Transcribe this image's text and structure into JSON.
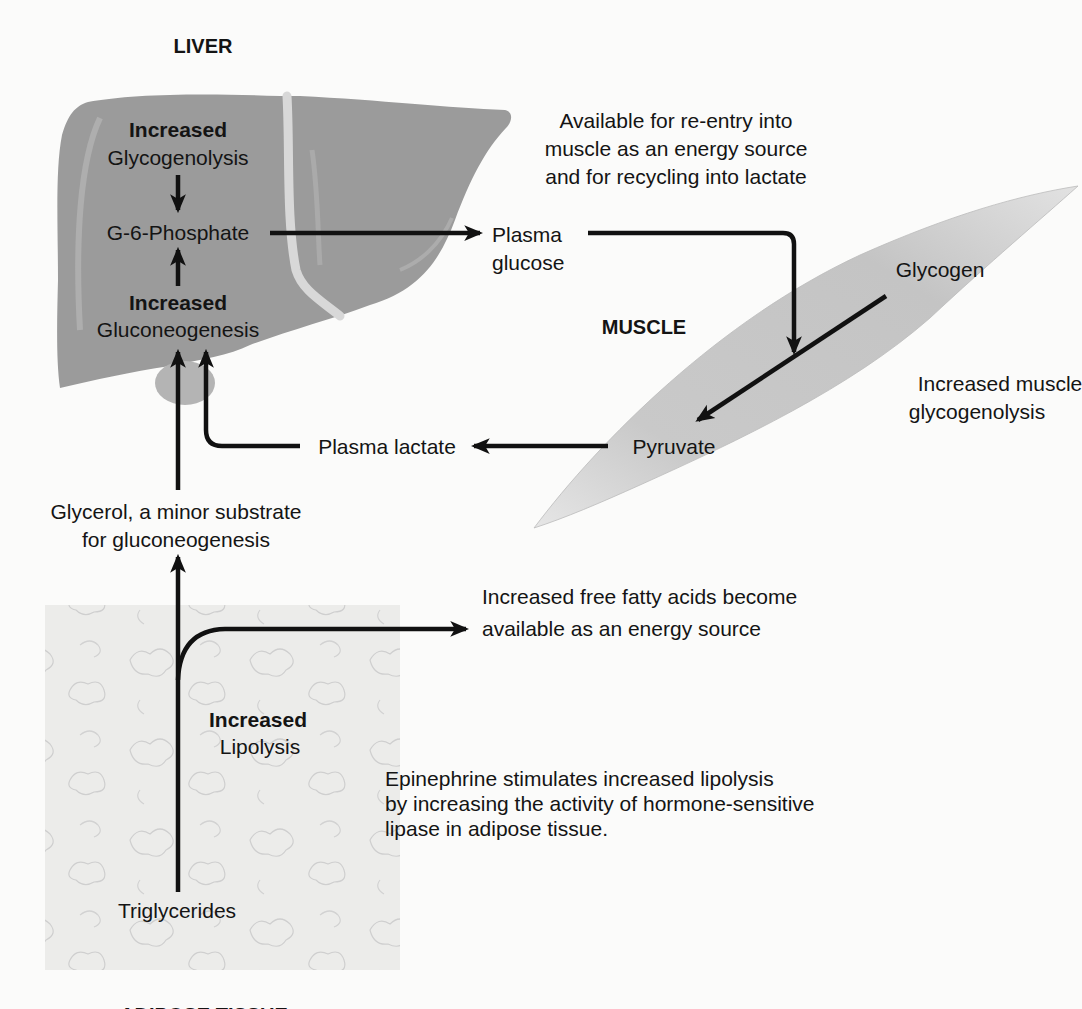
{
  "organs": {
    "liver": {
      "title": "LIVER",
      "color": "#9a9a9a",
      "glycogenolysis": {
        "qualifier": "Increased",
        "process": "Glycogenolysis"
      },
      "g6p": "G-6-Phosphate",
      "gluconeogenesis": {
        "qualifier": "Increased",
        "process": "Gluconeogenesis"
      }
    },
    "muscle": {
      "title": "MUSCLE",
      "color": "#c6c6c6",
      "glycogen": "Glycogen",
      "pyruvate": "Pyruvate",
      "glycogenolysis_note": [
        "Increased muscle",
        "glycogenolysis"
      ]
    },
    "adipose": {
      "title": "ADIPOSE TISSUE",
      "color": "#ececea",
      "triglycerides": "Triglycerides",
      "lipolysis": {
        "qualifier": "Increased",
        "process": "Lipolysis"
      }
    }
  },
  "metabolites": {
    "plasma_glucose": [
      "Plasma",
      "glucose"
    ],
    "plasma_lactate": "Plasma lactate",
    "glycerol": [
      "Glycerol, a minor substrate",
      "for gluconeogenesis"
    ]
  },
  "annotations": {
    "glucose_fate": [
      "Available for re-entry into",
      "muscle as an energy source",
      "and for recycling into lactate"
    ],
    "ffa": [
      "Increased free fatty acids become",
      "available as an energy source"
    ],
    "epinephrine": [
      "Epinephrine stimulates increased lipolysis",
      "by increasing the activity of hormone-sensitive",
      "lipase in adipose tissue."
    ]
  },
  "flows": [
    {
      "from": "Glycogenolysis",
      "to": "G-6-Phosphate"
    },
    {
      "from": "Gluconeogenesis",
      "to": "G-6-Phosphate"
    },
    {
      "from": "G-6-Phosphate",
      "to": "Plasma glucose"
    },
    {
      "from": "Plasma glucose",
      "to": "Muscle"
    },
    {
      "from": "Glycogen",
      "to": "Pyruvate"
    },
    {
      "from": "Pyruvate",
      "to": "Plasma lactate"
    },
    {
      "from": "Plasma lactate",
      "to": "Gluconeogenesis"
    },
    {
      "from": "Glycerol",
      "to": "Gluconeogenesis"
    },
    {
      "from": "Triglycerides",
      "to": "Glycerol"
    },
    {
      "from": "Triglycerides",
      "to": "Free fatty acids"
    }
  ]
}
